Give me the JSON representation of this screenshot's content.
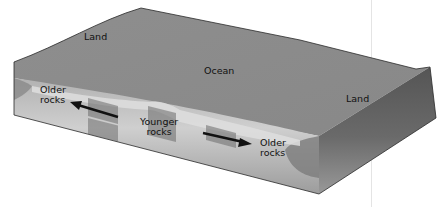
{
  "diagram": {
    "labels": {
      "land_left": "Land",
      "ocean": "Ocean",
      "land_right": "Land",
      "older_left_1": "Older",
      "older_left_2": "rocks",
      "younger_1": "Younger",
      "younger_2": "rocks",
      "older_right_1": "Older",
      "older_right_2": "rocks"
    },
    "arrows": [
      {
        "name": "arrow-left",
        "direction": "left",
        "from": "Younger rocks",
        "to": "Older rocks"
      },
      {
        "name": "arrow-right",
        "direction": "right",
        "from": "Younger rocks",
        "to": "Older rocks"
      }
    ],
    "colors": {
      "top_surface": "#8a8a8a",
      "front_face_light": "#c9c9c9",
      "front_face_dark": "#9a9a9a",
      "right_face": "#5e5e5e",
      "ridge_band": "#d6d6d6",
      "rock_stripe": "#6f6f6f",
      "outline": "#2a2a2a",
      "arrow": "#111111"
    }
  }
}
